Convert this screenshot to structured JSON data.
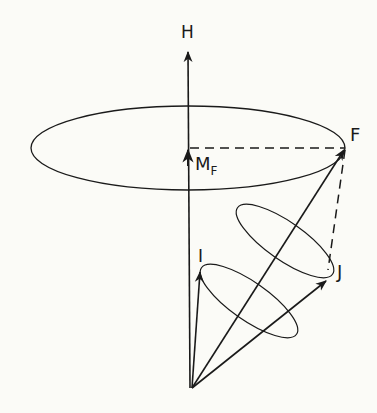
{
  "diagram": {
    "title": "",
    "colors": {
      "background": "#fbfbf7",
      "ink": "#1a1a1a"
    },
    "labels": {
      "H": "H",
      "F": "F",
      "M": "M",
      "M_sub": "F",
      "I": "I",
      "J": "J"
    },
    "vectors": [
      {
        "name": "H",
        "description": "magnetic field axis"
      },
      {
        "name": "F",
        "description": "total angular momentum F = I + J"
      },
      {
        "name": "I",
        "description": "nuclear spin"
      },
      {
        "name": "J",
        "description": "electronic angular momentum"
      },
      {
        "name": "M_F",
        "description": "projection of F on H"
      }
    ]
  }
}
